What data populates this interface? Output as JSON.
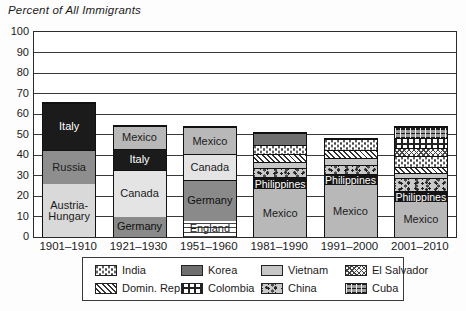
{
  "figure": {
    "title": "Percent of All Immigrants"
  },
  "chart_data": {
    "type": "bar",
    "stacked": true,
    "title": "Percent of All Immigrants",
    "xlabel": "",
    "ylabel": "Percent of All Immigrants",
    "ylim": [
      0,
      100
    ],
    "ytick_interval": 10,
    "ytick_labels": [
      "0",
      "10",
      "20",
      "30",
      "40",
      "50",
      "60",
      "70",
      "80",
      "90",
      "100"
    ],
    "grid": true,
    "legend_position": "bottom",
    "categories": [
      "1901–1910",
      "1921–1930",
      "1951–1960",
      "1981–1990",
      "1991–2000",
      "2001–2010"
    ],
    "bars": [
      {
        "category": "1901–1910",
        "total": 66,
        "segments": [
          {
            "name": "Austria-Hungary",
            "value": 26,
            "labeled": true
          },
          {
            "name": "Russia",
            "value": 17,
            "labeled": true
          },
          {
            "name": "Italy",
            "value": 23,
            "labeled": true
          }
        ]
      },
      {
        "category": "1921–1930",
        "total": 54.5,
        "segments": [
          {
            "name": "Germany",
            "value": 10,
            "labeled": true
          },
          {
            "name": "Canada",
            "value": 23,
            "labeled": true
          },
          {
            "name": "Italy",
            "value": 10.5,
            "labeled": true
          },
          {
            "name": "Mexico",
            "value": 11,
            "labeled": true
          }
        ]
      },
      {
        "category": "1951–1960",
        "total": 54,
        "segments": [
          {
            "name": "England",
            "value": 8,
            "labeled": true
          },
          {
            "name": "Germany",
            "value": 20,
            "labeled": true
          },
          {
            "name": "Canada",
            "value": 13,
            "labeled": true
          },
          {
            "name": "Mexico",
            "value": 13,
            "labeled": true
          }
        ]
      },
      {
        "category": "1981–1990",
        "total": 51,
        "segments": [
          {
            "name": "Mexico",
            "value": 23.5,
            "labeled": true
          },
          {
            "name": "Philippines",
            "value": 6,
            "labeled": true
          },
          {
            "name": "China",
            "value": 4.5,
            "labeled": false
          },
          {
            "name": "Vietnam",
            "value": 3,
            "labeled": false
          },
          {
            "name": "Domin. Rep.",
            "value": 4,
            "labeled": false
          },
          {
            "name": "India",
            "value": 4.5,
            "labeled": false
          },
          {
            "name": "Korea",
            "value": 5.5,
            "labeled": false
          }
        ]
      },
      {
        "category": "1991–2000",
        "total": 48.5,
        "segments": [
          {
            "name": "Mexico",
            "value": 25.5,
            "labeled": true
          },
          {
            "name": "Philippines",
            "value": 5.5,
            "labeled": true
          },
          {
            "name": "China",
            "value": 4.5,
            "labeled": false
          },
          {
            "name": "Vietnam",
            "value": 3.5,
            "labeled": false
          },
          {
            "name": "Domin. Rep.",
            "value": 4,
            "labeled": false
          },
          {
            "name": "India",
            "value": 5.5,
            "labeled": false
          }
        ]
      },
      {
        "category": "2001–2010",
        "total": 54,
        "segments": [
          {
            "name": "Mexico",
            "value": 17,
            "labeled": true
          },
          {
            "name": "Philippines",
            "value": 5.5,
            "labeled": true
          },
          {
            "name": "China",
            "value": 6.5,
            "labeled": false
          },
          {
            "name": "Vietnam",
            "value": 2.5,
            "labeled": false
          },
          {
            "name": "Domin. Rep.",
            "value": 3,
            "labeled": false
          },
          {
            "name": "India",
            "value": 5.5,
            "labeled": false
          },
          {
            "name": "El Salvador",
            "value": 4,
            "labeled": false
          },
          {
            "name": "Colombia",
            "value": 4.5,
            "labeled": false
          },
          {
            "name": "Cuba",
            "value": 5.5,
            "labeled": false
          }
        ]
      }
    ],
    "legend": {
      "rows": [
        [
          "India",
          "Korea",
          "Vietnam",
          "El Salvador"
        ],
        [
          "Domin. Rep.",
          "Colombia",
          "China",
          "Cuba"
        ]
      ]
    },
    "styles": {
      "Italy": {
        "pattern": "solid",
        "color": "#1b1b1b",
        "text": "#ffffff"
      },
      "Russia": {
        "pattern": "solid",
        "color": "#8e8e8e",
        "text": "#1b1b1b"
      },
      "Austria-Hungary": {
        "pattern": "solid",
        "color": "#d9d9d9",
        "text": "#1b1b1b"
      },
      "Mexico": {
        "pattern": "solid",
        "color": "#b8b8b8",
        "text": "#1b1b1b"
      },
      "Canada": {
        "pattern": "solid",
        "color": "#e4e4e4",
        "text": "#1b1b1b"
      },
      "Germany": {
        "pattern": "solid",
        "color": "#8a8a8a",
        "text": "#0f0f0f"
      },
      "England": {
        "pattern": "hlines",
        "color": "#ffffff",
        "text": "#1b1b1b"
      },
      "Philippines": {
        "pattern": "solid",
        "color": "#151515",
        "text": "#ffffff"
      },
      "Korea": {
        "pattern": "solid",
        "color": "#6f6f6f",
        "text": "#1b1b1b"
      },
      "Vietnam": {
        "pattern": "solid",
        "color": "#c6c6c6",
        "text": "#1b1b1b"
      },
      "China": {
        "pattern": "speckle",
        "color": "#c9c9c9",
        "text": "#1b1b1b"
      },
      "India": {
        "pattern": "dots",
        "color": "#ffffff",
        "text": "#1b1b1b"
      },
      "Domin. Rep.": {
        "pattern": "diag",
        "color": "#ffffff",
        "text": "#1b1b1b"
      },
      "El Salvador": {
        "pattern": "cross",
        "color": "#f4f4f4",
        "text": "#1b1b1b"
      },
      "Colombia": {
        "pattern": "vbars",
        "color": "#ffffff",
        "text": "#1b1b1b"
      },
      "Cuba": {
        "pattern": "brick",
        "color": "#9a9a9a",
        "text": "#1b1b1b"
      }
    }
  }
}
